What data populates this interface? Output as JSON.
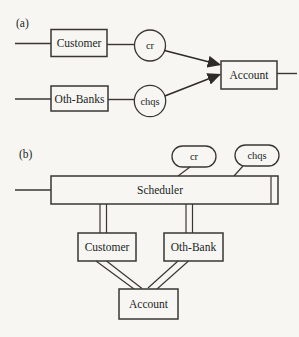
{
  "page": {
    "paper_color": "#f7f6f3",
    "ink_color": "#3a3733",
    "text_color": "#211f1c"
  },
  "diagram": {
    "panel_a": {
      "label": "(a)",
      "customer": "Customer",
      "oth_banks": "Oth-Banks",
      "cr": "cr",
      "chqs": "chqs",
      "account": "Account"
    },
    "panel_b": {
      "label": "(b)",
      "cr": "cr",
      "chqs": "chqs",
      "scheduler": "Scheduler",
      "customer": "Customer",
      "oth_bank": "Oth-Bank",
      "account": "Account"
    }
  }
}
